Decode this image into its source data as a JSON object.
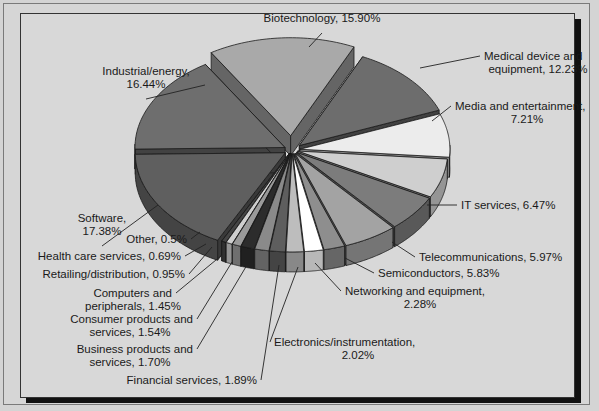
{
  "chart_data": {
    "type": "pie",
    "style": "3d-exploded",
    "title": "",
    "start_label": "Biotechnology",
    "slices": [
      {
        "label": "Biotechnology",
        "value": 15.9,
        "text": [
          "Biotechnology, 15.90%"
        ],
        "color": "#a9a9a9",
        "explode": 22
      },
      {
        "label": "Medical device and equipment",
        "value": 12.23,
        "text": [
          "Medical device and",
          "equipment, 12.23%"
        ],
        "color": "#6d6d6d",
        "explode": 10
      },
      {
        "label": "Media and entertainment",
        "value": 7.21,
        "text": [
          "Media and entertainment,",
          "7.21%"
        ],
        "color": "#ececec",
        "explode": 8
      },
      {
        "label": "IT services",
        "value": 6.47,
        "text": [
          "IT services, 6.47%"
        ],
        "color": "#cfcfcf",
        "explode": 6
      },
      {
        "label": "Telecommunications",
        "value": 5.97,
        "text": [
          "Telecommunications, 5.97%"
        ],
        "color": "#7c7c7c",
        "explode": 6
      },
      {
        "label": "Semiconductors",
        "value": 5.83,
        "text": [
          "Semiconductors, 5.83%"
        ],
        "color": "#a3a3a3",
        "explode": 6
      },
      {
        "label": "Networking and equipment",
        "value": 2.28,
        "text": [
          "Networking and equipment,",
          "2.28%"
        ],
        "color": "#8e8e8e",
        "explode": 6
      },
      {
        "label": "Electronics/instrumentation",
        "value": 2.02,
        "text": [
          "Electronics/instrumentation,",
          "2.02%"
        ],
        "color": "#ffffff",
        "explode": 6
      },
      {
        "label": "Financial services",
        "value": 1.89,
        "text": [
          "Financial services, 1.89%"
        ],
        "color": "#bdbdbd",
        "explode": 6
      },
      {
        "label": "Business products and services",
        "value": 1.7,
        "text": [
          "Business products and",
          "services, 1.70%"
        ],
        "color": "#5e5e5e",
        "explode": 6
      },
      {
        "label": "Consumer products and services",
        "value": 1.54,
        "text": [
          "Consumer products and",
          "services, 1.54%"
        ],
        "color": "#8a8a8a",
        "explode": 6
      },
      {
        "label": "Computers and peripherals",
        "value": 1.45,
        "text": [
          "Computers and",
          "peripherals, 1.45%"
        ],
        "color": "#2c2c2c",
        "explode": 6
      },
      {
        "label": "Retailing/distribution",
        "value": 0.95,
        "text": [
          "Retailing/distribution, 0.95%"
        ],
        "color": "#9a9a9a",
        "explode": 6
      },
      {
        "label": "Health care services",
        "value": 0.69,
        "text": [
          "Health care services, 0.69%"
        ],
        "color": "#cfcfcf",
        "explode": 6
      },
      {
        "label": "Other",
        "value": 0.5,
        "text": [
          "Other, 0.5%"
        ],
        "color": "#444444",
        "explode": 6
      },
      {
        "label": "Software",
        "value": 17.38,
        "text": [
          "Software,",
          "17.38%"
        ],
        "color": "#5f5f5f",
        "explode": 8
      },
      {
        "label": "Industrial/energy",
        "value": 16.44,
        "text": [
          "Industrial/energy,",
          "16.44%"
        ],
        "color": "#6e6e6e",
        "explode": 8
      }
    ],
    "labels_layout": [
      {
        "x": 322,
        "y": 22,
        "anchor": "middle",
        "lx": 309,
        "ly": 47
      },
      {
        "x": 484,
        "y": 60,
        "anchor": "start",
        "lx": 420,
        "ly": 68
      },
      {
        "x": 455,
        "y": 110,
        "anchor": "start",
        "lx": 432,
        "ly": 121
      },
      {
        "x": 461,
        "y": 209,
        "anchor": "start",
        "lx": 427,
        "ly": 205
      },
      {
        "x": 419,
        "y": 261,
        "anchor": "start",
        "lx": 392,
        "ly": 242
      },
      {
        "x": 378,
        "y": 277,
        "anchor": "start",
        "lx": 345,
        "ly": 258
      },
      {
        "x": 345,
        "y": 295,
        "anchor": "start",
        "lx": 315,
        "ly": 263
      },
      {
        "x": 274,
        "y": 346,
        "anchor": "start",
        "lx": 298,
        "ly": 267
      },
      {
        "x": 257,
        "y": 384,
        "anchor": "end",
        "lx": 279,
        "ly": 265
      },
      {
        "x": 193,
        "y": 353,
        "anchor": "end",
        "lx": 247,
        "ly": 265
      },
      {
        "x": 193,
        "y": 323,
        "anchor": "end",
        "lx": 232,
        "ly": 262
      },
      {
        "x": 172,
        "y": 297,
        "anchor": "end",
        "lx": 222,
        "ly": 255
      },
      {
        "x": 185,
        "y": 278,
        "anchor": "end",
        "lx": 212,
        "ly": 247
      },
      {
        "x": 181,
        "y": 260,
        "anchor": "end",
        "lx": 206,
        "ly": 244
      },
      {
        "x": 187,
        "y": 243,
        "anchor": "end",
        "lx": 200,
        "ly": 232
      },
      {
        "x": 102,
        "y": 222,
        "anchor": "middle",
        "lx": 158,
        "ly": 205
      },
      {
        "x": 146,
        "y": 75,
        "anchor": "middle",
        "lx": 205,
        "ly": 85
      }
    ]
  }
}
